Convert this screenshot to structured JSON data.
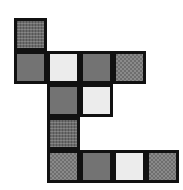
{
  "figure": {
    "shape_type": "polyomino",
    "grid": {
      "rows": 5,
      "columns": 5,
      "cell_size": 33,
      "origin_x": 14,
      "origin_y": 18,
      "border_width": 3,
      "border_color": "#111111"
    },
    "background_color": "#ffffff",
    "palette": {
      "gray": "#737373",
      "light": "#ececec",
      "checker": "#6e6e6e",
      "dither": "#6b6b6b"
    },
    "cells": [
      {
        "name": "cell-r1c1",
        "row": 1,
        "col": 1,
        "fill": "dither",
        "x": 14,
        "y": 18
      },
      {
        "name": "cell-r2c1",
        "row": 2,
        "col": 1,
        "fill": "gray",
        "x": 14,
        "y": 51
      },
      {
        "name": "cell-r2c2",
        "row": 2,
        "col": 2,
        "fill": "light",
        "x": 47,
        "y": 51
      },
      {
        "name": "cell-r2c3",
        "row": 2,
        "col": 3,
        "fill": "gray",
        "x": 80,
        "y": 51
      },
      {
        "name": "cell-r2c4",
        "row": 2,
        "col": 4,
        "fill": "checker",
        "x": 113,
        "y": 51
      },
      {
        "name": "cell-r3c2",
        "row": 3,
        "col": 2,
        "fill": "gray",
        "x": 47,
        "y": 84
      },
      {
        "name": "cell-r3c3",
        "row": 3,
        "col": 3,
        "fill": "light",
        "x": 80,
        "y": 84
      },
      {
        "name": "cell-r4c2",
        "row": 4,
        "col": 2,
        "fill": "dither",
        "x": 47,
        "y": 117
      },
      {
        "name": "cell-r5c2",
        "row": 5,
        "col": 2,
        "fill": "checker",
        "x": 47,
        "y": 150
      },
      {
        "name": "cell-r5c3",
        "row": 5,
        "col": 3,
        "fill": "gray",
        "x": 80,
        "y": 150
      },
      {
        "name": "cell-r5c4",
        "row": 5,
        "col": 4,
        "fill": "light",
        "x": 113,
        "y": 150
      },
      {
        "name": "cell-r5c5",
        "row": 5,
        "col": 5,
        "fill": "checker",
        "x": 146,
        "y": 150
      }
    ]
  }
}
